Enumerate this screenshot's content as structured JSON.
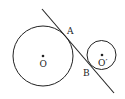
{
  "diagram": {
    "type": "geometry",
    "colors": {
      "stroke": "#222222",
      "background": "#ffffff"
    },
    "circles": [
      {
        "id": "circle-o",
        "cx": 43,
        "cy": 56,
        "r": 30,
        "center_label": "O"
      },
      {
        "id": "circle-o-prime",
        "cx": 101.5,
        "cy": 55,
        "r": 14.5,
        "center_label": "O′"
      }
    ],
    "tangent_line": {
      "x1": 42,
      "y1": 9,
      "x2": 114,
      "y2": 93
    },
    "points": [
      {
        "name": "A",
        "label": "A",
        "x": 69,
        "y": 32
      },
      {
        "name": "B",
        "label": "B",
        "x": 84,
        "y": 73
      }
    ],
    "labels": {
      "center_o": "O",
      "center_o_prime": "O′",
      "point_a": "A",
      "point_b": "B"
    }
  }
}
